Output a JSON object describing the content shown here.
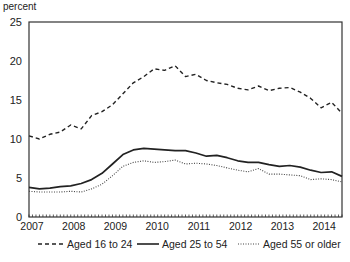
{
  "chart_data": {
    "type": "line",
    "title": "",
    "xlabel": "",
    "ylabel": "percent",
    "xlim": [
      2007.0,
      2014.5
    ],
    "ylim": [
      0,
      25
    ],
    "yticks": [
      0,
      5,
      10,
      15,
      20,
      25
    ],
    "xticks": [
      "2007",
      "2008",
      "2009",
      "2010",
      "2011",
      "2012",
      "2013",
      "2014"
    ],
    "grid": false,
    "legend_position": "bottom",
    "x": [
      2007.0,
      2007.25,
      2007.5,
      2007.75,
      2008.0,
      2008.25,
      2008.5,
      2008.75,
      2009.0,
      2009.25,
      2009.5,
      2009.75,
      2010.0,
      2010.25,
      2010.5,
      2010.75,
      2011.0,
      2011.25,
      2011.5,
      2011.75,
      2012.0,
      2012.25,
      2012.5,
      2012.75,
      2013.0,
      2013.25,
      2013.5,
      2013.75,
      2014.0,
      2014.25,
      2014.5
    ],
    "series": [
      {
        "name": "Aged 16 to 24",
        "style": "dashed",
        "values": [
          10.4,
          10.0,
          10.6,
          10.9,
          11.8,
          11.3,
          13.0,
          13.5,
          14.4,
          15.8,
          17.2,
          18.0,
          19.0,
          18.8,
          19.4,
          18.0,
          18.3,
          17.5,
          17.2,
          17.0,
          16.5,
          16.3,
          16.8,
          16.2,
          16.5,
          16.6,
          16.0,
          15.2,
          14.0,
          14.7,
          13.3
        ]
      },
      {
        "name": "Aged 25 to 54",
        "style": "solid",
        "values": [
          3.8,
          3.6,
          3.7,
          3.9,
          4.0,
          4.3,
          4.8,
          5.6,
          6.8,
          8.0,
          8.6,
          8.8,
          8.7,
          8.6,
          8.5,
          8.5,
          8.2,
          7.8,
          7.9,
          7.6,
          7.2,
          7.0,
          7.0,
          6.7,
          6.5,
          6.6,
          6.4,
          6.0,
          5.7,
          5.8,
          5.2
        ]
      },
      {
        "name": "Aged 55 or older",
        "style": "dotted",
        "values": [
          3.3,
          3.2,
          3.2,
          3.2,
          3.3,
          3.2,
          3.6,
          4.2,
          5.3,
          6.5,
          7.0,
          7.2,
          7.0,
          7.1,
          7.3,
          6.8,
          6.9,
          6.8,
          6.6,
          6.3,
          6.0,
          5.8,
          6.2,
          5.5,
          5.5,
          5.4,
          5.3,
          4.8,
          4.9,
          4.8,
          4.5
        ]
      }
    ]
  },
  "axis": {
    "y_unit_label": "percent"
  },
  "legend": {
    "items": [
      {
        "label": "Aged 16 to 24",
        "style": "dashed"
      },
      {
        "label": "Aged 25 to 54",
        "style": "solid"
      },
      {
        "label": "Aged 55 or older",
        "style": "dotted"
      }
    ]
  },
  "colors": {
    "line": "#222222",
    "axis": "#333333"
  }
}
